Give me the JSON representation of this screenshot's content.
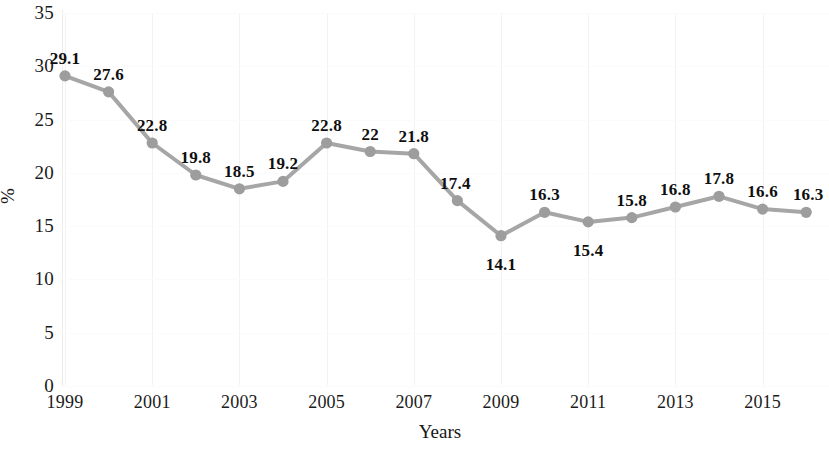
{
  "chart_data": {
    "type": "line",
    "title": "",
    "xlabel": "Years",
    "ylabel": "%",
    "grid": true,
    "legend": false,
    "ylim": [
      0,
      35
    ],
    "ytick_values": [
      35,
      30,
      25,
      20,
      15,
      10,
      5,
      0
    ],
    "ytick_labels": [
      "35",
      "30",
      "25",
      "20",
      "15",
      "10",
      "5",
      "0"
    ],
    "xtick_labels": [
      "1999",
      "2001",
      "2003",
      "2005",
      "2007",
      "2009",
      "2011",
      "2013",
      "2015"
    ],
    "xlim": [
      1999,
      2016
    ],
    "categories": [
      "1999",
      "2000",
      "2001",
      "2002",
      "2003",
      "2004",
      "2005",
      "2006",
      "2007",
      "2008",
      "2009",
      "2010",
      "2011",
      "2012",
      "2013",
      "2014",
      "2015",
      "2016"
    ],
    "values": [
      29.1,
      27.6,
      22.8,
      19.8,
      18.5,
      19.2,
      22.8,
      22,
      21.8,
      17.4,
      14.1,
      16.3,
      15.4,
      15.8,
      16.8,
      17.8,
      16.6,
      16.3
    ],
    "data_labels": [
      "29.1",
      "27.6",
      "22.8",
      "19.8",
      "18.5",
      "19.2",
      "22.8",
      "22",
      "21.8",
      "17.4",
      "14.1",
      "16.3",
      "15.4",
      "15.8",
      "16.8",
      "17.8",
      "16.6",
      "16.3"
    ],
    "series": [
      {
        "name": "percentage",
        "line_color": "#a6a6a6",
        "marker_color": "#9d9d9d",
        "marker": "circle",
        "values": [
          29.1,
          27.6,
          22.8,
          19.8,
          18.5,
          19.2,
          22.8,
          22,
          21.8,
          17.4,
          14.1,
          16.3,
          15.4,
          15.8,
          16.8,
          17.8,
          16.6,
          16.3
        ]
      }
    ],
    "colors": {
      "line": "#a6a6a6",
      "marker": "#9d9d9d",
      "text": "#1a1a1a",
      "grid": "#f2f2f2",
      "axis": "#e6e6e6",
      "background": "#ffffff"
    }
  }
}
